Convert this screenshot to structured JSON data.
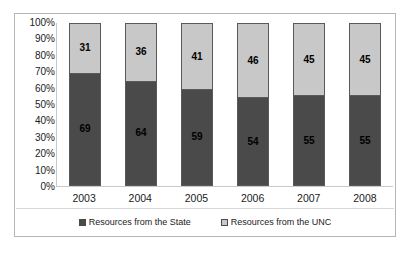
{
  "chart_data": {
    "type": "bar",
    "subtype": "stacked-100-percent",
    "title": "",
    "xlabel": "",
    "ylabel": "",
    "categories": [
      "2003",
      "2004",
      "2005",
      "2006",
      "2007",
      "2008"
    ],
    "series": [
      {
        "name": "Resources from the State",
        "color": "#4a4a4a",
        "values": [
          69,
          64,
          59,
          54,
          55,
          55
        ]
      },
      {
        "name": "Resources from the UNC",
        "color": "#c8c8c8",
        "values": [
          31,
          36,
          41,
          46,
          45,
          45
        ]
      }
    ],
    "ylim": [
      0,
      100
    ],
    "ytick_labels": [
      "100%",
      "90%",
      "80%",
      "70%",
      "60%",
      "50%",
      "40%",
      "30%",
      "20%",
      "10%",
      "0%"
    ],
    "ytick_values": [
      100,
      90,
      80,
      70,
      60,
      50,
      40,
      30,
      20,
      10,
      0
    ],
    "grid": false,
    "legend_position": "bottom",
    "data_labels": true
  },
  "legend": {
    "items": [
      {
        "label": "Resources from the State",
        "swatch": "state-swatch-icon"
      },
      {
        "label": "Resources from the UNC",
        "swatch": "unc-swatch-icon"
      }
    ]
  },
  "colors": {
    "series_state": "#4a4a4a",
    "series_unc": "#c8c8c8",
    "frame_border": "#b6b6b6",
    "axis_line": "#c9c9c9",
    "bar_outline": "#5a5a5a",
    "text": "#1b1b1b",
    "background": "#ffffff"
  }
}
